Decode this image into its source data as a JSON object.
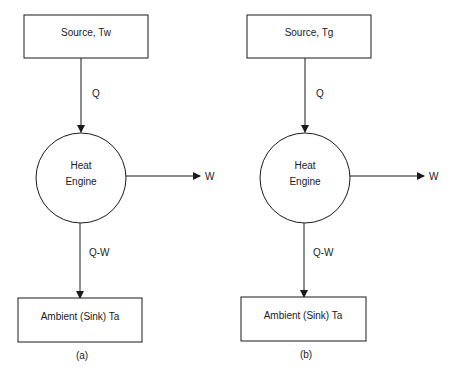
{
  "diagrams": [
    {
      "caption": "(a)",
      "source": {
        "label": "Source, Tw"
      },
      "engine": {
        "line1": "Heat",
        "line2": "Engine"
      },
      "heat_in": {
        "label": "Q"
      },
      "work_out": {
        "label": "W"
      },
      "heat_out": {
        "label": "Q-W"
      },
      "sink": {
        "label": "Ambient (Sink) Ta"
      }
    },
    {
      "caption": "(b)",
      "source": {
        "label": "Source, Tg"
      },
      "engine": {
        "line1": "Heat",
        "line2": "Engine"
      },
      "heat_in": {
        "label": "Q"
      },
      "work_out": {
        "label": "W"
      },
      "heat_out": {
        "label": "Q-W"
      },
      "sink": {
        "label": "Ambient (Sink) Ta"
      }
    }
  ],
  "colors": {
    "stroke": "#1a1a1a",
    "background": "#ffffff"
  }
}
